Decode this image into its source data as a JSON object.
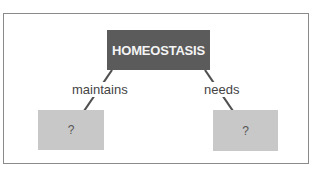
{
  "diagram": {
    "type": "concept-map",
    "root": {
      "label": "HOMEOSTASIS",
      "fill": "#5b5b5b",
      "text_color": "#f4f4f4"
    },
    "links": [
      {
        "label": "maintains",
        "target": "left"
      },
      {
        "label": "needs",
        "target": "right"
      }
    ],
    "children": {
      "left": {
        "label": "?",
        "fill": "#c8c8c8"
      },
      "right": {
        "label": "?",
        "fill": "#c8c8c8"
      }
    },
    "line_color": "#505050",
    "border_color": "#8a8a8a"
  }
}
